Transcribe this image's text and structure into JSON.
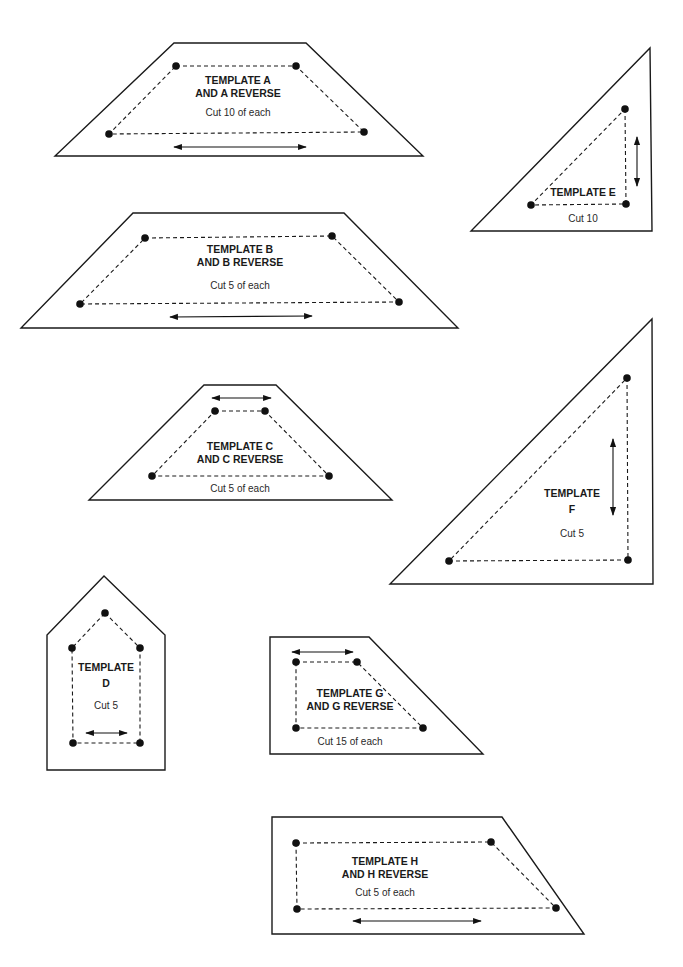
{
  "templates": [
    {
      "id": "A",
      "title_lines": [
        "TEMPLATE A",
        "AND A REVERSE"
      ],
      "cut": "Cut 10 of each",
      "outline": [
        [
          174,
          43
        ],
        [
          306,
          43
        ],
        [
          423,
          156
        ],
        [
          55,
          156
        ]
      ],
      "seam": [
        [
          176,
          66
        ],
        [
          296,
          66
        ],
        [
          364,
          132
        ],
        [
          109,
          134
        ]
      ],
      "grain": [
        [
          174,
          147
        ],
        [
          306,
          147
        ]
      ],
      "title_pos": [
        238,
        84
      ],
      "line_gap": 13,
      "cut_pos": [
        238,
        116
      ]
    },
    {
      "id": "B",
      "title_lines": [
        "TEMPLATE B",
        "AND B REVERSE"
      ],
      "cut": "Cut 5 of each",
      "outline": [
        [
          133,
          213
        ],
        [
          344,
          213
        ],
        [
          458,
          328
        ],
        [
          21,
          328
        ]
      ],
      "seam": [
        [
          145,
          238
        ],
        [
          332,
          236
        ],
        [
          399,
          302
        ],
        [
          80,
          304
        ]
      ],
      "grain": [
        [
          170,
          317
        ],
        [
          312,
          316
        ]
      ],
      "title_pos": [
        240,
        253
      ],
      "line_gap": 13,
      "cut_pos": [
        240,
        289
      ]
    },
    {
      "id": "C",
      "title_lines": [
        "TEMPLATE C",
        "AND C REVERSE"
      ],
      "cut": "Cut 5 of each",
      "outline": [
        [
          204,
          385
        ],
        [
          276,
          385
        ],
        [
          392,
          500
        ],
        [
          89,
          500
        ]
      ],
      "seam": [
        [
          215,
          411
        ],
        [
          265,
          411
        ],
        [
          329,
          476
        ],
        [
          152,
          476
        ]
      ],
      "grain": [
        [
          212,
          398
        ],
        [
          271,
          398
        ]
      ],
      "title_pos": [
        240,
        450
      ],
      "line_gap": 13,
      "cut_pos": [
        240,
        492
      ]
    },
    {
      "id": "D",
      "title_lines": [
        "TEMPLATE",
        "D"
      ],
      "cut": "Cut 5",
      "outline": [
        [
          104,
          576
        ],
        [
          165,
          635
        ],
        [
          165,
          770
        ],
        [
          47,
          770
        ],
        [
          47,
          635
        ]
      ],
      "seam": [
        [
          105,
          613
        ],
        [
          140,
          648
        ],
        [
          140,
          743
        ],
        [
          73,
          743
        ],
        [
          72,
          648
        ]
      ],
      "grain": [
        [
          86,
          733
        ],
        [
          127,
          733
        ]
      ],
      "title_pos": [
        106,
        671
      ],
      "line_gap": 16,
      "cut_pos": [
        106,
        709
      ]
    },
    {
      "id": "E",
      "title_lines": [
        "TEMPLATE E"
      ],
      "cut": "Cut 10",
      "outline": [
        [
          650,
          48
        ],
        [
          652,
          231
        ],
        [
          471,
          231
        ]
      ],
      "seam": [
        [
          625,
          109
        ],
        [
          626,
          204
        ],
        [
          531,
          205
        ]
      ],
      "grain": [
        [
          637,
          137
        ],
        [
          637,
          186
        ]
      ],
      "title_pos": [
        583,
        196
      ],
      "line_gap": 0,
      "cut_pos": [
        583,
        222
      ]
    },
    {
      "id": "F",
      "title_lines": [
        "TEMPLATE",
        "F"
      ],
      "cut": "Cut 5",
      "outline": [
        [
          652,
          319
        ],
        [
          653,
          584
        ],
        [
          390,
          584
        ]
      ],
      "seam": [
        [
          627,
          378
        ],
        [
          628,
          560
        ],
        [
          449,
          561
        ]
      ],
      "grain": [
        [
          613,
          439
        ],
        [
          613,
          515
        ]
      ],
      "title_pos": [
        572,
        497
      ],
      "line_gap": 16,
      "cut_pos": [
        572,
        537
      ]
    },
    {
      "id": "G",
      "title_lines": [
        "TEMPLATE G",
        "AND G REVERSE"
      ],
      "cut": "Cut 15 of each",
      "outline": [
        [
          270,
          637
        ],
        [
          369,
          637
        ],
        [
          483,
          754
        ],
        [
          270,
          754
        ]
      ],
      "seam": [
        [
          296,
          662
        ],
        [
          357,
          662
        ],
        [
          423,
          728
        ],
        [
          296,
          728
        ]
      ],
      "grain": [
        [
          292,
          652
        ],
        [
          353,
          652
        ]
      ],
      "title_pos": [
        350,
        697
      ],
      "line_gap": 13,
      "cut_pos": [
        350,
        745
      ]
    },
    {
      "id": "H",
      "title_lines": [
        "TEMPLATE H",
        "AND H REVERSE"
      ],
      "cut": "Cut 5 of each",
      "outline": [
        [
          272,
          817
        ],
        [
          502,
          817
        ],
        [
          584,
          934
        ],
        [
          272,
          934
        ]
      ],
      "seam": [
        [
          296,
          843
        ],
        [
          491,
          842
        ],
        [
          556,
          908
        ],
        [
          297,
          909
        ]
      ],
      "grain": [
        [
          353,
          921
        ],
        [
          481,
          921
        ]
      ],
      "title_pos": [
        385,
        865
      ],
      "line_gap": 13,
      "cut_pos": [
        385,
        896
      ]
    }
  ]
}
